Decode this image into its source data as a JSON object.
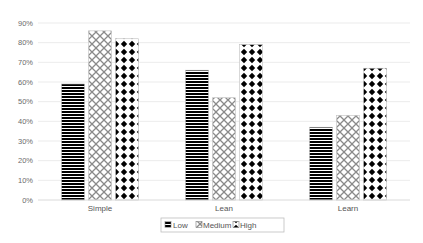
{
  "chart_data": {
    "type": "bar",
    "title": "",
    "xlabel": "",
    "ylabel": "",
    "categories": [
      "Simple",
      "Lean",
      "Learn"
    ],
    "series": [
      {
        "name": "Low",
        "pattern": "horizontal-stripes",
        "values": [
          59,
          66,
          37
        ]
      },
      {
        "name": "Medium",
        "pattern": "diagonal-crosshatch",
        "values": [
          86,
          52,
          43
        ]
      },
      {
        "name": "High",
        "pattern": "diamond-dots",
        "values": [
          82,
          79,
          67
        ]
      }
    ],
    "ylim": [
      0,
      90
    ],
    "yticks": [
      0,
      10,
      20,
      30,
      40,
      50,
      60,
      70,
      80,
      90
    ],
    "ytick_labels": [
      "0%",
      "10%",
      "20%",
      "30%",
      "40%",
      "50%",
      "60%",
      "70%",
      "80%",
      "90%"
    ],
    "grid": true,
    "legend": {
      "position": "bottom",
      "entries": [
        "Low",
        "Medium",
        "High"
      ]
    },
    "colors": {
      "gridline": "#e6e6e6",
      "axis": "#d0d0d0",
      "stripe": "#000000",
      "crosshatch": "#8a8a8a",
      "dot": "#000000",
      "bar_border": "#bfbfbf"
    }
  }
}
